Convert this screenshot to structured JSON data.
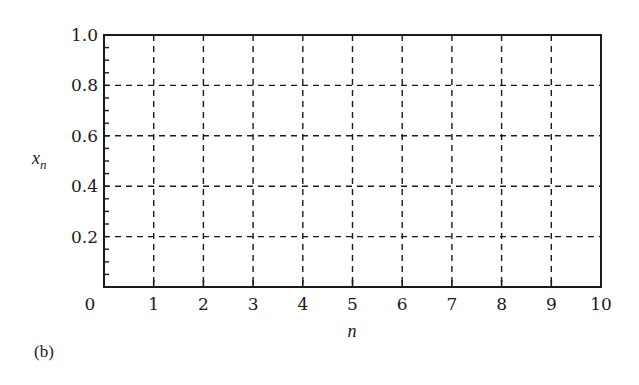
{
  "chart_data": {
    "type": "line",
    "title": "",
    "panel_label": "(b)",
    "xlabel": "n",
    "ylabel": "x_n",
    "ylabel_main": "x",
    "ylabel_sub": "n",
    "xlim": [
      0,
      10
    ],
    "ylim": [
      0,
      1.0
    ],
    "x_ticks": [
      0,
      1,
      2,
      3,
      4,
      5,
      6,
      7,
      8,
      9,
      10
    ],
    "x_tick_labels": [
      "0",
      "1",
      "2",
      "3",
      "4",
      "5",
      "6",
      "7",
      "8",
      "9",
      "10"
    ],
    "y_ticks": [
      0.2,
      0.4,
      0.6,
      0.8,
      1.0
    ],
    "y_tick_labels": [
      "0.2",
      "0.4",
      "0.6",
      "0.8",
      "1.0"
    ],
    "y_minor_step": 0.05,
    "grid": true,
    "grid_style": "dashed",
    "series": [],
    "legend": null
  },
  "colors": {
    "ink": "#1a1a1a",
    "background": "#ffffff"
  }
}
